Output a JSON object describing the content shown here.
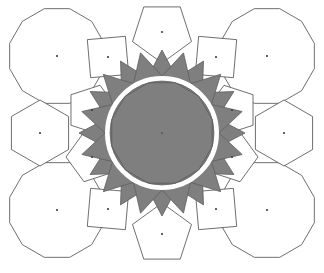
{
  "figure": {
    "canvas": {
      "width": 324,
      "height": 273,
      "background": "#ffffff"
    },
    "palette": {
      "outline_stroke": "#4a4a4a",
      "tile_fill": "#ffffff",
      "shaded_fill": "#7f7f7f",
      "shaded_stroke": "#5e5e5e",
      "center_dot": "#3c3c3c"
    }
  },
  "geometry": {
    "center": {
      "x": 162,
      "y": 133
    },
    "core_dodecagon": {
      "sides": 12,
      "circumradius": 52,
      "rotation_deg": 15,
      "fill": "#7f7f7f"
    },
    "star_ring": {
      "points": 12,
      "outer_radius": 83,
      "inner_radius": 57,
      "fill": "#7f7f7f",
      "description": "twelve-pointed star formed by two overlapping shaded dodecagrams"
    },
    "white_annulus": {
      "inner_radius": 52,
      "outer_radius": 57
    },
    "corner_dodecagons": [
      {
        "name": "top-left",
        "sides": 12,
        "cx": 57,
        "cy": 56,
        "circumradius": 49,
        "rotation_deg": 15
      },
      {
        "name": "top-right",
        "sides": 12,
        "cx": 267,
        "cy": 56,
        "circumradius": 49,
        "rotation_deg": 15
      },
      {
        "name": "bottom-left",
        "sides": 12,
        "cx": 57,
        "cy": 210,
        "circumradius": 49,
        "rotation_deg": 15
      },
      {
        "name": "bottom-right",
        "sides": 12,
        "cx": 267,
        "cy": 210,
        "circumradius": 49,
        "rotation_deg": 15
      }
    ],
    "edge_pentagons": [
      {
        "name": "top-center",
        "sides": 5,
        "cx": 162,
        "cy": 32,
        "circumradius": 31,
        "rotation_deg": 180
      },
      {
        "name": "bottom-center",
        "sides": 5,
        "cx": 162,
        "cy": 234,
        "circumradius": 31,
        "rotation_deg": 0
      }
    ],
    "side_hexagons": [
      {
        "name": "left-middle",
        "sides": 6,
        "cx": 40,
        "cy": 133,
        "circumradius": 33,
        "rotation_deg": 0
      },
      {
        "name": "right-middle",
        "sides": 6,
        "cx": 284,
        "cy": 133,
        "circumradius": 33,
        "rotation_deg": 0
      }
    ],
    "inner_quads": [
      {
        "name": "upper-left-square",
        "sides": 4,
        "cx": 108,
        "cy": 57,
        "circumradius": 27,
        "rotation_deg": 40
      },
      {
        "name": "upper-right-square",
        "sides": 4,
        "cx": 216,
        "cy": 57,
        "circumradius": 27,
        "rotation_deg": 50
      },
      {
        "name": "lower-left-square",
        "sides": 4,
        "cx": 108,
        "cy": 209,
        "circumradius": 27,
        "rotation_deg": 50
      },
      {
        "name": "lower-right-square",
        "sides": 4,
        "cx": 216,
        "cy": 209,
        "circumradius": 27,
        "rotation_deg": 40
      }
    ],
    "inner_pentagons": [
      {
        "name": "left-upper-pentagon",
        "sides": 5,
        "cx": 92,
        "cy": 110,
        "circumradius": 26,
        "rotation_deg": 18
      },
      {
        "name": "left-lower-pentagon",
        "sides": 5,
        "cx": 92,
        "cy": 157,
        "circumradius": 26,
        "rotation_deg": 198
      },
      {
        "name": "right-upper-pentagon",
        "sides": 5,
        "cx": 232,
        "cy": 110,
        "circumradius": 26,
        "rotation_deg": -18
      },
      {
        "name": "right-lower-pentagon",
        "sides": 5,
        "cx": 232,
        "cy": 157,
        "circumradius": 26,
        "rotation_deg": 162
      }
    ],
    "center_dot_radius": 1.1,
    "center_dots": [
      {
        "x": 57,
        "y": 56
      },
      {
        "x": 267,
        "y": 56
      },
      {
        "x": 57,
        "y": 210
      },
      {
        "x": 267,
        "y": 210
      },
      {
        "x": 162,
        "y": 32
      },
      {
        "x": 162,
        "y": 234
      },
      {
        "x": 40,
        "y": 133
      },
      {
        "x": 284,
        "y": 133
      },
      {
        "x": 108,
        "y": 57
      },
      {
        "x": 216,
        "y": 57
      },
      {
        "x": 108,
        "y": 209
      },
      {
        "x": 216,
        "y": 209
      },
      {
        "x": 92,
        "y": 110
      },
      {
        "x": 92,
        "y": 157
      },
      {
        "x": 232,
        "y": 110
      },
      {
        "x": 232,
        "y": 157
      },
      {
        "x": 162,
        "y": 133
      }
    ]
  }
}
